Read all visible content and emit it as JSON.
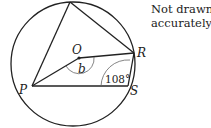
{
  "note": {
    "line1": "Not drawn",
    "line2": "accurately"
  },
  "points": {
    "O": {
      "label": "O",
      "x": 79,
      "y": 58
    },
    "P": {
      "label": "P",
      "x": 32,
      "y": 86
    },
    "R": {
      "label": "R",
      "x": 134,
      "y": 53
    },
    "S": {
      "label": "S",
      "x": 128,
      "y": 86
    },
    "T": {
      "x": 70,
      "y": 2
    }
  },
  "circle": {
    "cx": 73,
    "cy": 64,
    "r": 62
  },
  "angles": {
    "b": {
      "label": "b",
      "at": "O"
    },
    "s": {
      "label": "108°",
      "at": "S"
    }
  },
  "colors": {
    "line": "#222222",
    "arc": "#555555"
  }
}
